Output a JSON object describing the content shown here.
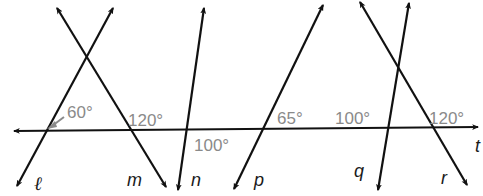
{
  "diagram": {
    "type": "parallel-lines-transversal",
    "transversal": {
      "name": "t",
      "label": "t"
    },
    "lines": [
      {
        "name": "l",
        "label": "ℓ"
      },
      {
        "name": "m",
        "label": "m"
      },
      {
        "name": "n",
        "label": "n"
      },
      {
        "name": "p",
        "label": "p"
      },
      {
        "name": "q",
        "label": "q"
      },
      {
        "name": "r",
        "label": "r"
      }
    ],
    "angles": [
      {
        "at": "l",
        "label": "60°"
      },
      {
        "at": "m",
        "label": "120°"
      },
      {
        "at": "n",
        "label": "100°"
      },
      {
        "at": "p",
        "label": "65°"
      },
      {
        "at": "q",
        "label": "100°"
      },
      {
        "at": "r",
        "label": "120°"
      }
    ],
    "colors": {
      "line": "#111111",
      "angle_text": "#8a8a8a",
      "label_text": "#1a1a1a"
    }
  }
}
